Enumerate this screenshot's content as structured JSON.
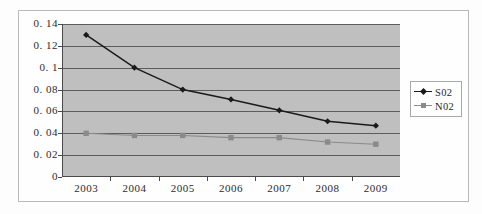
{
  "chart_data": {
    "type": "line",
    "title": "",
    "subtitle": "",
    "xlabel": "",
    "ylabel": "",
    "categories": [
      "2003",
      "2004",
      "2005",
      "2006",
      "2007",
      "2008",
      "2009"
    ],
    "series": [
      {
        "name": "S02",
        "color": "#1a1a1a",
        "marker": "diamond",
        "values": [
          0.13,
          0.1,
          0.08,
          0.071,
          0.061,
          0.051,
          0.047
        ]
      },
      {
        "name": "N02",
        "color": "#8a8a8a",
        "marker": "square",
        "values": [
          0.04,
          0.038,
          0.038,
          0.036,
          0.036,
          0.032,
          0.03
        ]
      }
    ],
    "ylim": [
      0,
      0.14
    ],
    "ytick_labels": [
      "0",
      "0. 02",
      "0. 04",
      "0. 06",
      "0. 08",
      "0. 1",
      "0. 12",
      "0. 14"
    ],
    "ytick_values": [
      0,
      0.02,
      0.04,
      0.06,
      0.08,
      0.1,
      0.12,
      0.14
    ],
    "grid": true,
    "legend_position": "right",
    "plot_background": "#bfbfbf",
    "figure_background": "#fefefe",
    "axis_color": "#4a4a4a",
    "gridline_color": "#5c5c5c"
  }
}
